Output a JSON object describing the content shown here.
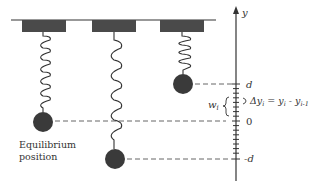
{
  "diagram": {
    "axis_label": "y",
    "tick_labels": {
      "top": "d",
      "zero": "0",
      "bottom": "-d"
    },
    "width_label": "w",
    "width_sub": "i",
    "delta_label": "Δy",
    "delta_sub": "i",
    "delta_eq": " = y",
    "delta_eq_sub": "i",
    "delta_minus": " - y",
    "delta_minus_sub": "i-1",
    "equilibrium_line1": "Equilibrium",
    "equilibrium_line2": "position",
    "colors": {
      "ink": "#333333",
      "block": "#4a4a4a",
      "mass": "#3a3a3a"
    }
  }
}
